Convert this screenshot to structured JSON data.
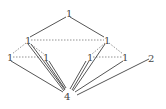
{
  "diagram": {
    "type": "graph",
    "nodes": [
      {
        "id": "top",
        "label": "1",
        "x": 68,
        "y": 13
      },
      {
        "id": "left_mid",
        "label": "1",
        "x": 27,
        "y": 40
      },
      {
        "id": "right_mid",
        "label": "1",
        "x": 107,
        "y": 40
      },
      {
        "id": "far_left",
        "label": "1",
        "x": 10,
        "y": 57
      },
      {
        "id": "left_inner",
        "label": "1",
        "x": 45,
        "y": 57
      },
      {
        "id": "right_inner",
        "label": "1",
        "x": 90,
        "y": 57
      },
      {
        "id": "far_right",
        "label": "1",
        "x": 125,
        "y": 57
      },
      {
        "id": "two",
        "label": "2",
        "x": 152,
        "y": 58
      },
      {
        "id": "bottom",
        "label": "4",
        "x": 67,
        "y": 96
      }
    ],
    "edges_solid": [
      [
        "top",
        "left_mid"
      ],
      [
        "top",
        "right_mid"
      ],
      [
        "far_left",
        "bottom"
      ],
      [
        "left_mid",
        "bottom"
      ],
      [
        "left_inner",
        "bottom"
      ],
      [
        "right_inner",
        "bottom"
      ],
      [
        "right_mid",
        "bottom"
      ],
      [
        "far_right",
        "bottom"
      ],
      [
        "two",
        "bottom"
      ]
    ],
    "edges_dashed": [
      [
        "left_mid",
        "right_mid"
      ],
      [
        "left_mid",
        "far_left"
      ],
      [
        "left_mid",
        "left_inner"
      ],
      [
        "far_left",
        "left_inner"
      ],
      [
        "right_mid",
        "right_inner"
      ],
      [
        "right_mid",
        "far_right"
      ],
      [
        "right_inner",
        "far_right"
      ]
    ]
  },
  "labels": {
    "top": "1",
    "left_mid": "1",
    "right_mid": "1",
    "far_left": "1",
    "left_inner": "1",
    "right_inner": "1",
    "far_right": "1",
    "two": "2",
    "bottom": "4"
  }
}
